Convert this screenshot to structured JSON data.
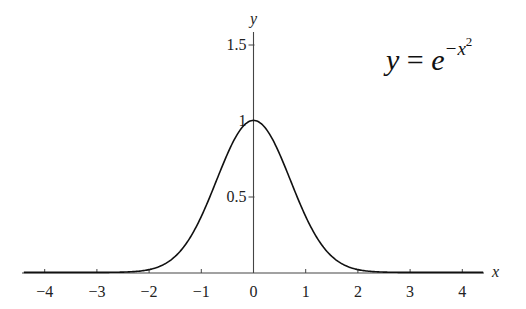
{
  "chart_data": {
    "type": "line",
    "xlabel": "x",
    "ylabel": "y",
    "xlim": [
      -4.4,
      4.4
    ],
    "ylim": [
      0,
      1.6
    ],
    "grid": false,
    "legend": null,
    "annotation": "y = e^{-x^2}",
    "x_ticks": [
      "−4",
      "−3",
      "−2",
      "−1",
      "0",
      "1",
      "2",
      "3",
      "4"
    ],
    "y_ticks": [
      "0.5",
      "1",
      "1.5"
    ],
    "series": [
      {
        "name": "y = e^{-x^2}",
        "function": "exp(-x^2)",
        "x": [
          -4,
          -3,
          -2.5,
          -2,
          -1.5,
          -1,
          -0.5,
          0,
          0.5,
          1,
          1.5,
          2,
          2.5,
          3,
          4
        ],
        "values": [
          0.0,
          0.0001,
          0.0019,
          0.0183,
          0.1054,
          0.3679,
          0.7788,
          1.0,
          0.7788,
          0.3679,
          0.1054,
          0.0183,
          0.0019,
          0.0001,
          0.0
        ]
      }
    ]
  },
  "labels": {
    "x_axis": "x",
    "y_axis": "y",
    "formula_lhs": "y",
    "formula_eq": " = ",
    "formula_base": "e",
    "formula_exp": "−x",
    "formula_exp_power": "2"
  },
  "colors": {
    "axis": "#444444",
    "curve": "#111111",
    "background": "#ffffff"
  }
}
